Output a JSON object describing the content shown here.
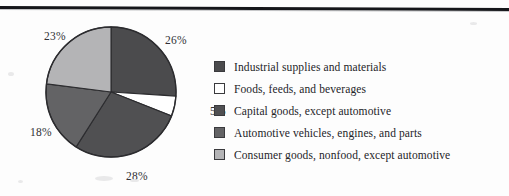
{
  "figure": {
    "has_top_rule": true,
    "background_color": "#fdfdfd"
  },
  "chart_data": {
    "type": "pie",
    "title": "",
    "subtitle": "",
    "xlabel": "",
    "ylabel": "",
    "grid": false,
    "legend_position": "right",
    "start_angle_deg": 0,
    "direction": "clockwise",
    "categories": [
      "Industrial supplies and materials",
      "Foods, feeds, and beverages",
      "Capital goods, except automotive",
      "Automotive vehicles, engines, and parts",
      "Consumer goods, nonfood, except automotive"
    ],
    "values": [
      26,
      5,
      28,
      18,
      23
    ],
    "data_labels": [
      "26%",
      "5%",
      "28%",
      "18%",
      "23%"
    ],
    "units": "percent",
    "colors": [
      "#4b4b4d",
      "#ffffff",
      "#505052",
      "#636365",
      "#b4b4b6"
    ],
    "slice_outline_color": "#2c2c2f",
    "slices": [
      {
        "label": "Industrial supplies and materials",
        "value": 26,
        "data_label": "26%",
        "color": "#4b4b4d"
      },
      {
        "label": "Foods, feeds, and beverages",
        "value": 5,
        "data_label": "5%",
        "color": "#ffffff"
      },
      {
        "label": "Capital goods, except automotive",
        "value": 28,
        "data_label": "28%",
        "color": "#505052"
      },
      {
        "label": "Automotive vehicles, engines, and parts",
        "value": 18,
        "data_label": "18%",
        "color": "#636365"
      },
      {
        "label": "Consumer goods, nonfood, except automotive",
        "value": 23,
        "data_label": "23%",
        "color": "#b4b4b6"
      }
    ]
  },
  "legend": {
    "items": [
      {
        "label": "Industrial supplies and materials",
        "color": "#4b4b4d"
      },
      {
        "label": "Foods, feeds, and beverages",
        "color": "#ffffff"
      },
      {
        "label": "Capital goods, except automotive",
        "color": "#505052"
      },
      {
        "label": "Automotive vehicles, engines, and parts",
        "color": "#636365"
      },
      {
        "label": "Consumer goods, nonfood, except automotive",
        "color": "#b4b4b6"
      }
    ]
  }
}
